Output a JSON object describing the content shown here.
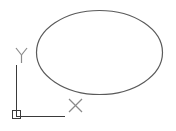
{
  "canvas": {
    "width": 176,
    "height": 131,
    "background": "#ffffff"
  },
  "ellipse": {
    "cx": 99.5,
    "cy": 52.5,
    "rx": 63,
    "ry": 42,
    "stroke": "#5a5a5a"
  },
  "ucs_icon": {
    "stroke": "#3a3a3a",
    "label_color": "#8a8a8a",
    "x_label": "X",
    "y_label": "Y"
  }
}
